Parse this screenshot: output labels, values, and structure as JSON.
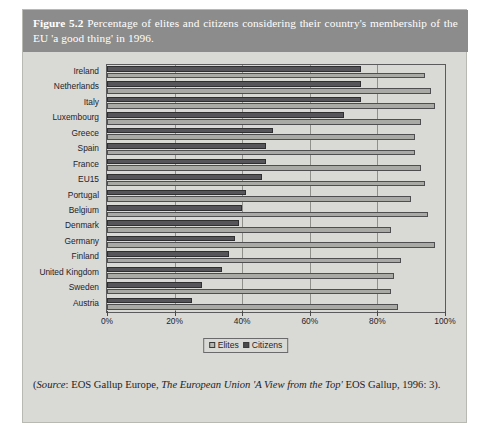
{
  "figure": {
    "number": "Figure 5.2",
    "caption": "Percentage of elites and citizens considering their country's membership of the EU 'a good thing' in 1996.",
    "caption_label": "Figure",
    "caption_num": "5.2",
    "caption_rest": "Percentage of elites and citizens considering their country's membership of the EU 'a good thing' in 1996."
  },
  "source": {
    "prefix": "(",
    "label": "Source",
    "text_a": ": EOS Gallup Europe, ",
    "title_italic": "The European Union 'A View from the Top'",
    "text_b": " EOS Gallup, 1996: 3)."
  },
  "legend": {
    "elites": "Elites",
    "citizens": "Citizens"
  },
  "colors": {
    "panel": "#d9d9d6",
    "caption_bar": "#8c8c8c",
    "elites_bar": "#a9a9a6",
    "citizens_bar": "#56565a",
    "grid": "#8f8f8c",
    "frame": "#5b5b5b"
  },
  "chart_data": {
    "type": "bar",
    "orientation": "horizontal",
    "title": "Percentage of elites and citizens considering their country's membership of the EU 'a good thing' in 1996",
    "xlabel": "",
    "ylabel": "",
    "xlim": [
      0,
      100
    ],
    "xticks": [
      0,
      20,
      40,
      60,
      80,
      100
    ],
    "xtick_labels": [
      "0%",
      "20%",
      "40%",
      "60%",
      "80%",
      "100%"
    ],
    "grid": true,
    "legend_position": "bottom-center",
    "categories": [
      "Ireland",
      "Netherlands",
      "Italy",
      "Luxembourg",
      "Greece",
      "Spain",
      "France",
      "EU15",
      "Portugal",
      "Belgium",
      "Denmark",
      "Germany",
      "Finland",
      "United Kingdom",
      "Sweden",
      "Austria"
    ],
    "series": [
      {
        "name": "Elites",
        "color": "#a9a9a6",
        "values": [
          94,
          96,
          97,
          93,
          91,
          91,
          93,
          94,
          90,
          95,
          84,
          97,
          87,
          85,
          84,
          86
        ]
      },
      {
        "name": "Citizens",
        "color": "#56565a",
        "values": [
          75,
          75,
          75,
          70,
          49,
          47,
          47,
          46,
          41,
          40,
          39,
          38,
          36,
          34,
          28,
          25
        ]
      }
    ]
  }
}
